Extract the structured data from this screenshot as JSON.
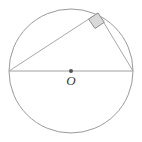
{
  "figure": {
    "background_color": "#ffffff",
    "stroke_color": "#9a9a9a",
    "chord_color": "#a8a8a8",
    "label_color": "#3a3a3a",
    "right_angle_fill": "#d9d9d9",
    "right_angle_stroke": "#8f8f8f",
    "center_dot_color": "#555555",
    "width": 142,
    "height": 142
  },
  "circle": {
    "name": "circumscribed-circle",
    "center_x": 71,
    "center_y": 71,
    "radius": 62,
    "stroke_width": 1
  },
  "points": {
    "center": {
      "label": "O",
      "x": 71,
      "y": 71
    },
    "left_vertex": {
      "label": "",
      "x": 9,
      "y": 71
    },
    "right_vertex": {
      "label": "",
      "x": 133,
      "y": 71
    },
    "apex_vertex": {
      "label": "",
      "x": 98,
      "y": 13
    }
  },
  "segments": [
    {
      "name": "diameter",
      "x1": 9,
      "y1": 71,
      "x2": 133,
      "y2": 71
    },
    {
      "name": "long-leg",
      "x1": 9,
      "y1": 71,
      "x2": 98,
      "y2": 13
    },
    {
      "name": "short-leg",
      "x1": 98,
      "y1": 13,
      "x2": 133,
      "y2": 71
    }
  ],
  "right_angle_marker": {
    "name": "right-angle-square",
    "at_vertex": "apex_vertex",
    "size": 11,
    "polygon": "98,13 88.6,19.1 95.0,28.5 104.3,22.3"
  },
  "center_label": {
    "text": "O",
    "x": 71,
    "y": 74
  }
}
